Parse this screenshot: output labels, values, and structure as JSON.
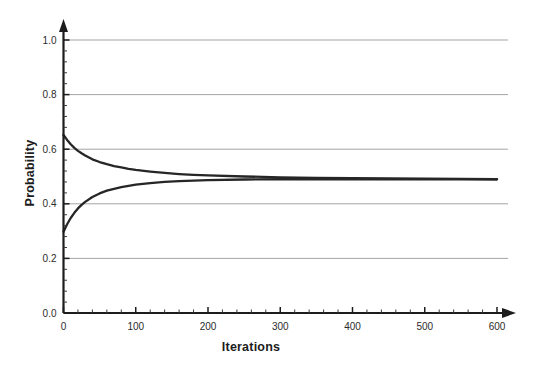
{
  "chart_data": {
    "type": "line",
    "title": "",
    "subtitle": "",
    "xlabel": "Iterations",
    "ylabel": "Probability",
    "xlim": [
      0,
      600
    ],
    "ylim": [
      0.0,
      1.0
    ],
    "xticks": [
      0,
      100,
      200,
      300,
      400,
      500,
      600
    ],
    "xtick_labels": [
      "0",
      "100",
      "200",
      "300",
      "400",
      "500",
      "600"
    ],
    "yticks": [
      0.0,
      0.2,
      0.4,
      0.6,
      0.8,
      1.0
    ],
    "ytick_labels": [
      "0.0",
      "0.2",
      "0.4",
      "0.6",
      "0.8",
      "1.0"
    ],
    "x_minor_tick_step": 20,
    "y_minor_tick_step": 0.04,
    "grid": {
      "horizontal": true,
      "vertical": false,
      "values": [
        0.2,
        0.4,
        0.6,
        0.8,
        1.0
      ],
      "color": "#9a9a9a"
    },
    "legend": {
      "visible": false,
      "position": "none",
      "entries": []
    },
    "annotations": [],
    "axis_arrows": {
      "x_axis_arrow": true,
      "y_axis_arrow": true
    },
    "converged_value": 0.49,
    "series": [
      {
        "name": "upper-curve",
        "color": "#262626",
        "x": [
          0,
          5,
          10,
          15,
          20,
          25,
          30,
          40,
          50,
          60,
          70,
          80,
          90,
          100,
          120,
          140,
          160,
          180,
          200,
          250,
          300,
          350,
          400,
          450,
          500,
          550,
          600
        ],
        "values": [
          0.652,
          0.634,
          0.618,
          0.605,
          0.594,
          0.585,
          0.577,
          0.563,
          0.553,
          0.545,
          0.538,
          0.533,
          0.528,
          0.524,
          0.518,
          0.513,
          0.509,
          0.506,
          0.504,
          0.5,
          0.497,
          0.495,
          0.494,
          0.493,
          0.492,
          0.491,
          0.49
        ]
      },
      {
        "name": "lower-curve",
        "color": "#262626",
        "x": [
          0,
          5,
          10,
          15,
          20,
          25,
          30,
          40,
          50,
          60,
          70,
          80,
          90,
          100,
          120,
          140,
          160,
          180,
          200,
          250,
          300,
          350,
          400,
          450,
          500,
          550,
          600
        ],
        "values": [
          0.298,
          0.325,
          0.348,
          0.367,
          0.383,
          0.396,
          0.407,
          0.425,
          0.438,
          0.448,
          0.455,
          0.461,
          0.466,
          0.47,
          0.476,
          0.48,
          0.483,
          0.485,
          0.487,
          0.489,
          0.49,
          0.49,
          0.49,
          0.49,
          0.49,
          0.49,
          0.49
        ]
      }
    ]
  }
}
